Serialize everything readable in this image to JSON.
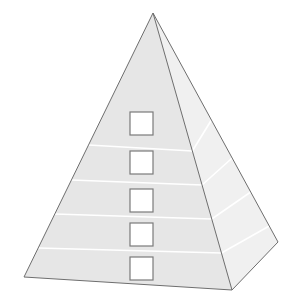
{
  "diagram": {
    "type": "pyramid",
    "title": "",
    "levels": 5,
    "apex": [
      153,
      13
    ],
    "front_face": {
      "bottom_left": [
        24,
        277
      ],
      "bottom_right": [
        232,
        290
      ],
      "fill": "#e6e6e6"
    },
    "side_face": {
      "back_right": [
        278,
        242
      ],
      "fill": "#f0f0f0"
    },
    "edge_color": "#6e6e6e",
    "band_color": "#ffffff",
    "bands": [
      {
        "y_left": 145,
        "y_right": 151,
        "side_y_end": 120
      },
      {
        "y_left": 180,
        "y_right": 185,
        "side_y_end": 158
      },
      {
        "y_left": 214,
        "y_right": 219,
        "side_y_end": 192
      },
      {
        "y_left": 248,
        "y_right": 253,
        "side_y_end": 226
      }
    ],
    "boxes": [
      {
        "label": "",
        "x": 130,
        "y": 112,
        "size": 23
      },
      {
        "label": "",
        "x": 130,
        "y": 151,
        "size": 23
      },
      {
        "label": "",
        "x": 130,
        "y": 189,
        "size": 23
      },
      {
        "label": "",
        "x": 130,
        "y": 223,
        "size": 23
      },
      {
        "label": "",
        "x": 130,
        "y": 257,
        "size": 23
      }
    ],
    "box_fill": "#ffffff",
    "box_stroke": "#7a7a7a"
  }
}
